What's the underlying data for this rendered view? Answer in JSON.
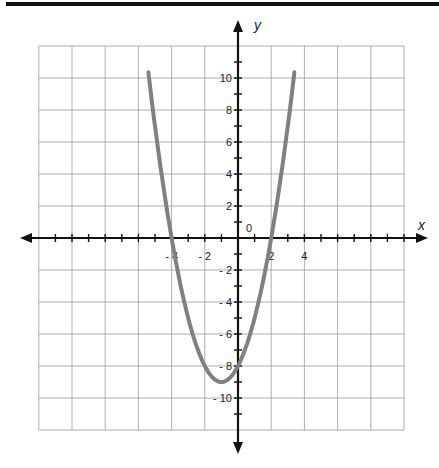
{
  "chart_data": {
    "type": "line",
    "title": "",
    "xlabel": "x",
    "ylabel": "y",
    "function": "y = x^2 + 2x - 8",
    "xlim": [
      -6,
      5
    ],
    "ylim": [
      -12,
      12
    ],
    "grid": true,
    "grid_step": 2,
    "x_tick_labels": [
      "-4",
      "-2",
      "2",
      "4"
    ],
    "y_tick_labels": [
      "10",
      "8",
      "6",
      "4",
      "2",
      "-2",
      "-4",
      "-6",
      "-8",
      "-10"
    ],
    "origin_label": "0",
    "series": [
      {
        "name": "parabola",
        "color": "#808080",
        "x": [
          -5.4,
          -5,
          -4,
          -3,
          -2,
          -1,
          0,
          1,
          2,
          3,
          3.4
        ],
        "y": [
          10.4,
          7,
          0,
          -5,
          -8,
          -9,
          -8,
          -5,
          0,
          7,
          10.4
        ]
      }
    ],
    "key_points": {
      "x_intercepts": [
        -4,
        2
      ],
      "y_intercept": -8,
      "vertex": [
        -1,
        -9
      ]
    }
  },
  "labels": {
    "x_axis": "x",
    "y_axis": "y",
    "origin": "0"
  }
}
